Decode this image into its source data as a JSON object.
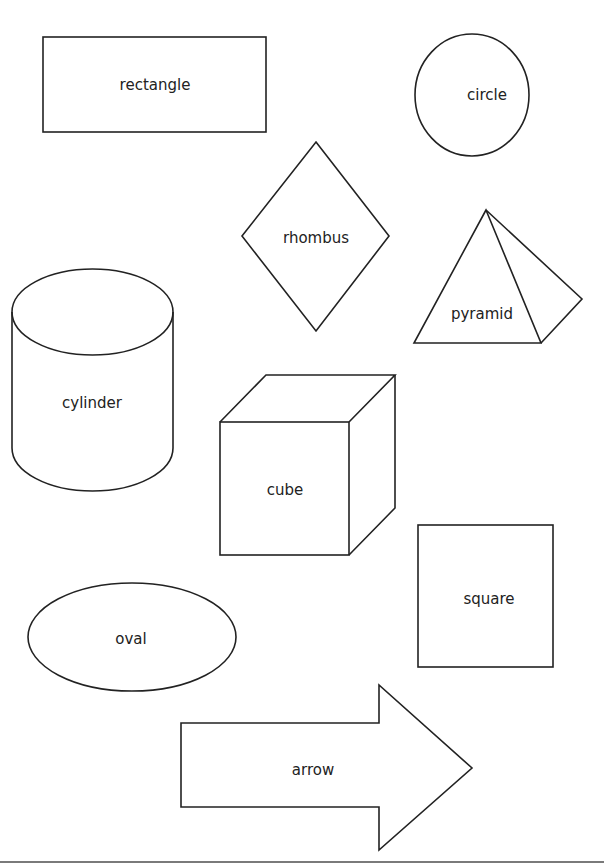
{
  "colors": {
    "stroke": "#222222",
    "background": "#ffffff",
    "baseline": "#7a7a7a"
  },
  "shapes": [
    {
      "id": "rectangle",
      "label": "rectangle"
    },
    {
      "id": "circle",
      "label": "circle"
    },
    {
      "id": "rhombus",
      "label": "rhombus"
    },
    {
      "id": "pyramid",
      "label": "pyramid"
    },
    {
      "id": "cylinder",
      "label": "cylinder"
    },
    {
      "id": "cube",
      "label": "cube"
    },
    {
      "id": "square",
      "label": "square"
    },
    {
      "id": "oval",
      "label": "oval"
    },
    {
      "id": "arrow",
      "label": "arrow"
    }
  ]
}
